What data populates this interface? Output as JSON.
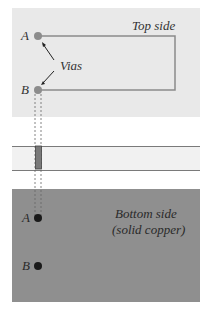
{
  "diagram": {
    "top_panel": {
      "label": "Top side",
      "color": "#e9e9e9"
    },
    "vias_label": "Vias",
    "via_a_label": "A",
    "via_b_label": "B",
    "bottom_panel": {
      "label_line1": "Bottom side",
      "label_line2": "(solid copper)",
      "color": "#8f8f8f"
    },
    "bottom_a_label": "A",
    "bottom_b_label": "B",
    "colors": {
      "trace": "#8a8a8a",
      "via_top": "#8c8c8c",
      "via_bottom": "#1a1a1a",
      "layer_strip": "#eeeeee",
      "via_barrel": "#777777"
    }
  }
}
